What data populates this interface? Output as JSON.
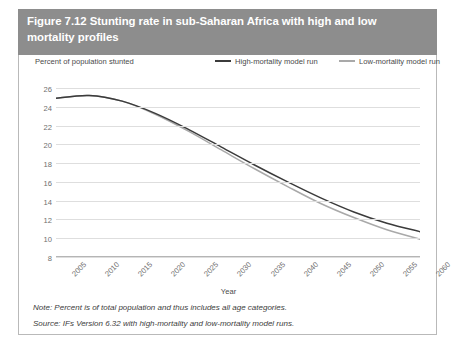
{
  "header": {
    "title": "Figure 7.12 Stunting rate in sub-Saharan Africa with high and low mortality profiles",
    "background_color": "#8d8d8d",
    "text_color": "#ffffff"
  },
  "notes": {
    "note": "Note: Percent is of total population and thus includes all age categories.",
    "source": "Source: IFs Version 6.32 with high-mortality and low-mortality model runs."
  },
  "chart_data": {
    "type": "line",
    "title": "Figure 7.12 Stunting rate in sub-Saharan Africa with high and low mortality profiles",
    "xlabel": "Year",
    "ylabel": "Percent of population stunted",
    "xlim": [
      2005,
      2060
    ],
    "ylim": [
      8,
      26
    ],
    "yticks": [
      8,
      10,
      12,
      14,
      16,
      18,
      20,
      22,
      24,
      26
    ],
    "xticks": [
      2005,
      2010,
      2015,
      2020,
      2025,
      2030,
      2035,
      2040,
      2045,
      2050,
      2055,
      2060
    ],
    "grid": true,
    "legend_position": "top-right",
    "x": [
      2005,
      2010,
      2015,
      2020,
      2025,
      2030,
      2035,
      2040,
      2045,
      2050,
      2055,
      2060
    ],
    "series": [
      {
        "name": "High-mortality model run",
        "color": "#3b3b3b",
        "values": [
          24.9,
          25.2,
          24.6,
          23.3,
          21.6,
          19.7,
          17.8,
          16.0,
          14.3,
          12.8,
          11.6,
          10.7
        ]
      },
      {
        "name": "Low-mortality model run",
        "color": "#a9a9a9",
        "values": [
          24.9,
          25.2,
          24.6,
          23.2,
          21.4,
          19.4,
          17.4,
          15.5,
          13.7,
          12.2,
          10.9,
          9.9
        ]
      }
    ]
  }
}
